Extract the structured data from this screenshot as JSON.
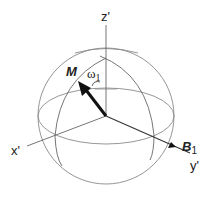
{
  "diagram": {
    "labels": {
      "z_axis": "z'",
      "x_axis": "x'",
      "y_axis": "y'",
      "magnetization": "M",
      "field": "B",
      "field_sub": "1",
      "omega": "ω",
      "omega_sub": "1"
    },
    "colors": {
      "line": "#7a7a7a",
      "axis": "#555555",
      "arrow": "#111111",
      "text": "#222222"
    }
  }
}
